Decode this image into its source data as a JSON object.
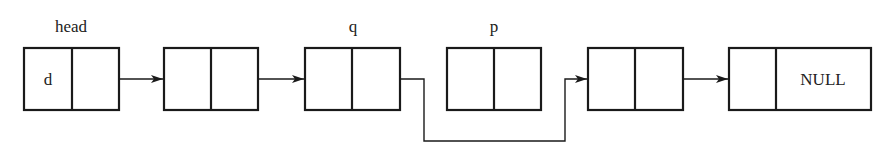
{
  "diagram": {
    "type": "linked-list",
    "colors": {
      "stroke": "#1a1a1a",
      "text": "#222222",
      "background": "#ffffff"
    },
    "pointer_labels": [
      {
        "id": "head",
        "text": "head",
        "node_index": 0
      },
      {
        "id": "q",
        "text": "q",
        "node_index": 2
      },
      {
        "id": "p",
        "text": "p",
        "node_index": 3
      }
    ],
    "nodes": [
      {
        "index": 0,
        "data": "d",
        "next": ""
      },
      {
        "index": 1,
        "data": "",
        "next": ""
      },
      {
        "index": 2,
        "data": "",
        "next": ""
      },
      {
        "index": 3,
        "data": "",
        "next": ""
      },
      {
        "index": 4,
        "data": "",
        "next": ""
      },
      {
        "index": 5,
        "data": "",
        "next": "NULL"
      }
    ],
    "links": [
      {
        "from": 0,
        "to": 1,
        "style": "straight"
      },
      {
        "from": 1,
        "to": 2,
        "style": "straight"
      },
      {
        "from": 2,
        "to": 4,
        "style": "routed-below",
        "bypasses": 3
      },
      {
        "from": 4,
        "to": 5,
        "style": "straight"
      }
    ]
  }
}
